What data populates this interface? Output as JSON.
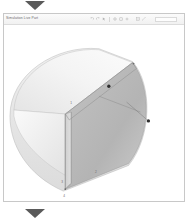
{
  "window": {
    "doc_title": "Simulation Live Part"
  },
  "toolbar": {
    "icons": [
      {
        "name": "undo-icon",
        "glyph": "undo"
      },
      {
        "name": "redo-icon",
        "glyph": "redo"
      },
      {
        "name": "cursor-icon",
        "glyph": "cursor"
      },
      {
        "name": "rotate-icon",
        "glyph": "rotate"
      },
      {
        "name": "pan-icon",
        "glyph": "pan"
      },
      {
        "name": "zoom-in-icon",
        "glyph": "plus"
      },
      {
        "name": "section-icon",
        "glyph": "section"
      },
      {
        "name": "measure-icon",
        "glyph": "measure"
      }
    ],
    "zoom_value": ""
  },
  "nav": {
    "prev_page_label": "",
    "next_page_label": ""
  },
  "figure": {
    "title": "",
    "surfaces": [
      {
        "name": "top-face",
        "fill": "#f2f2f2"
      },
      {
        "name": "left-face",
        "fill": "#e9e9e9"
      },
      {
        "name": "front-face",
        "fill": "#d9d9d9"
      },
      {
        "name": "curved-shell",
        "fill": "#bfbfbf"
      }
    ],
    "colors": {
      "outline": "#9a9a9a",
      "edge": "#8d8d8d",
      "leader": "#7a7a7a",
      "marker": "#2e2e2e",
      "label_text": "#6e6e6e"
    },
    "annotations": [
      {
        "name": "point-a",
        "label": "A",
        "x": 106,
        "y": 62
      },
      {
        "name": "point-b",
        "label": "B",
        "x": 146,
        "y": 97
      },
      {
        "name": "label-top-face",
        "label": "1",
        "x": 67,
        "y": 80
      },
      {
        "name": "label-front-face",
        "label": "2",
        "x": 92,
        "y": 150
      },
      {
        "name": "label-left-edge",
        "label": "3",
        "x": 58,
        "y": 160
      },
      {
        "name": "label-bottom",
        "label": "4",
        "x": 60,
        "y": 192
      }
    ]
  }
}
